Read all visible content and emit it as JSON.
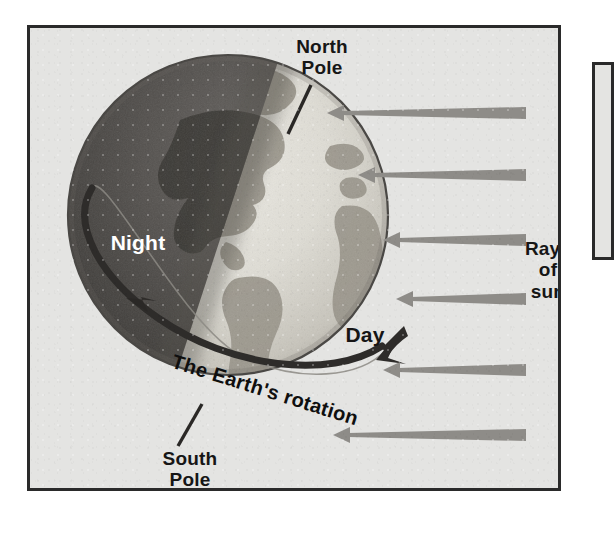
{
  "figure": {
    "background_color": "#e4e4e2",
    "border_color": "#2a2a2a",
    "labels": {
      "north_pole": "North\nPole",
      "south_pole": "South\nPole",
      "rays_of_sun": "Rays\nof\nsun",
      "night": "Night",
      "day": "Day",
      "rotation": "The Earth's rotation"
    },
    "globe": {
      "center_x": 198,
      "center_y": 187,
      "radius": 160,
      "lit_side": "right",
      "dark_side": "left",
      "ocean_lit_color": "#d8d6cf",
      "ocean_dark_color": "#4c4a47",
      "land_lit_color": "#9a968c",
      "land_dark_color": "#403e3b",
      "terminator_angle_deg": 22
    },
    "sun_rays": {
      "count": 6,
      "direction": "right-to-left",
      "color": "#8e8c88",
      "arrows": [
        {
          "y": 85,
          "tail_x": 496,
          "tip_x": 299
        },
        {
          "y": 147,
          "tail_x": 496,
          "tip_x": 330
        },
        {
          "y": 212,
          "tail_x": 496,
          "tip_x": 355
        },
        {
          "y": 271,
          "tail_x": 496,
          "tip_x": 368
        },
        {
          "y": 342,
          "tail_x": 496,
          "tip_x": 355
        },
        {
          "y": 407,
          "tail_x": 496,
          "tip_x": 305
        }
      ]
    },
    "rotation_band": {
      "color": "#2e2c2a",
      "direction": "west-to-east",
      "arrowhead": "upper-right"
    },
    "leader_lines": {
      "north_pole": {
        "x1": 281,
        "y1": 57,
        "x2": 258,
        "y2": 104
      },
      "south_pole": {
        "x1": 148,
        "y1": 418,
        "x2": 172,
        "y2": 378
      }
    }
  }
}
